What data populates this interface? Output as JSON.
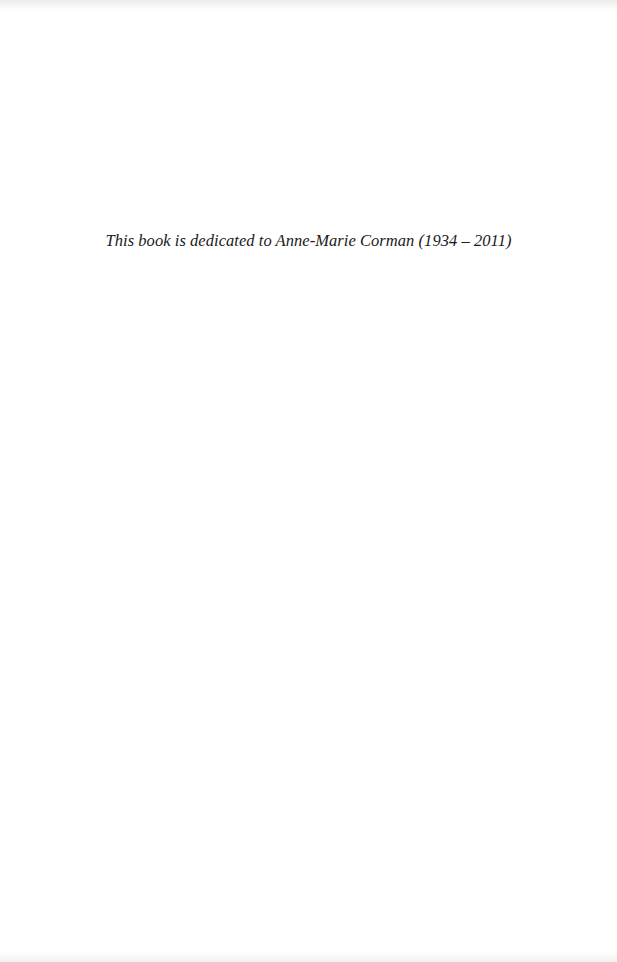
{
  "page": {
    "dedication": "This book is dedicated to Anne-Marie Corman (1934 – 2011)"
  },
  "colors": {
    "background": "#ffffff",
    "text": "#1a1a1a"
  }
}
